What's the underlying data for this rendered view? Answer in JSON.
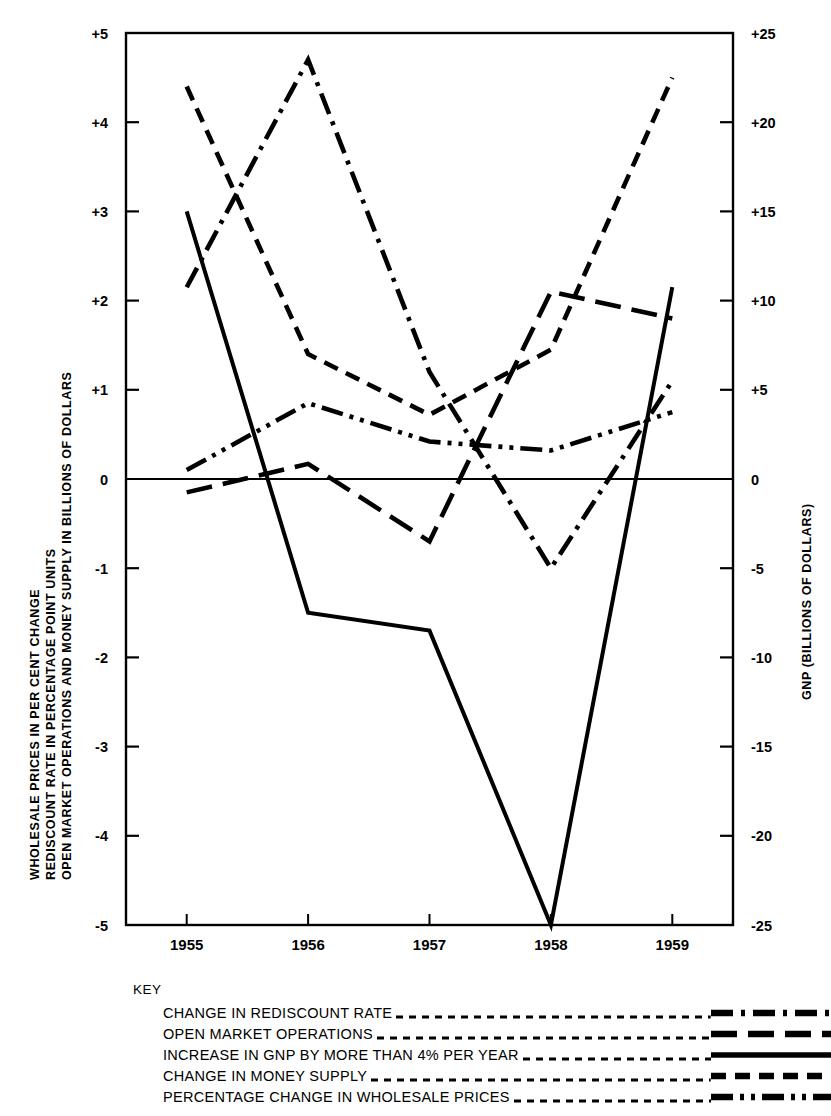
{
  "axes": {
    "left_title_lines": [
      "WHOLESALE PRICES IN PER CENT CHANGE",
      "REDISCOUNT RATE IN PERCENTAGE POINT UNITS",
      "OPEN MARKET OPERATIONS AND MONEY SUPPLY IN BILLIONS OF DOLLARS"
    ],
    "right_title": "GNP (BILLIONS OF DOLLARS)",
    "left_ticks": [
      "+5",
      "+4",
      "+3",
      "+2",
      "+1",
      "0",
      "-1",
      "-2",
      "-3",
      "-4",
      "-5"
    ],
    "right_ticks": [
      "+25",
      "+20",
      "+15",
      "+10",
      "+5",
      "0",
      "-5",
      "-10",
      "-15",
      "-20",
      "-25"
    ],
    "x_ticks": [
      "1955",
      "1956",
      "1957",
      "1958",
      "1959"
    ]
  },
  "key": {
    "title": "KEY",
    "entries": [
      {
        "label": "CHANGE IN REDISCOUNT RATE",
        "style": "dash-dot"
      },
      {
        "label": "OPEN MARKET OPERATIONS",
        "style": "long-dash"
      },
      {
        "label": "INCREASE IN GNP BY MORE THAN 4% PER YEAR",
        "style": "solid"
      },
      {
        "label": "CHANGE IN MONEY SUPPLY",
        "style": "medium-dash"
      },
      {
        "label": "PERCENTAGE CHANGE IN WHOLESALE PRICES",
        "style": "dash-dot-dot"
      }
    ]
  },
  "chart_data": {
    "type": "line",
    "title": "",
    "xlabel": "",
    "ylabel": "WHOLESALE PRICES IN PER CENT CHANGE / REDISCOUNT RATE IN PERCENTAGE POINT UNITS / OPEN MARKET OPERATIONS AND MONEY SUPPLY IN BILLIONS OF DOLLARS",
    "y2label": "GNP (BILLIONS OF DOLLARS)",
    "categories": [
      "1955",
      "1956",
      "1957",
      "1958",
      "1959"
    ],
    "ylim": [
      -5,
      5
    ],
    "y2lim": [
      -25,
      25
    ],
    "grid": false,
    "legend_position": "below",
    "zero_line": true,
    "series": [
      {
        "name": "CHANGE IN REDISCOUNT RATE",
        "style": "dash-dot",
        "axis": "left",
        "values": [
          2.15,
          4.7,
          1.2,
          -1.0,
          1.1
        ]
      },
      {
        "name": "OPEN MARKET OPERATIONS",
        "style": "long-dash",
        "axis": "left",
        "values": [
          -0.15,
          0.17,
          -0.7,
          2.1,
          1.8
        ]
      },
      {
        "name": "INCREASE IN GNP BY MORE THAN 4% PER YEAR",
        "style": "solid",
        "axis": "right",
        "values": [
          15.0,
          -7.5,
          -8.5,
          -25.0,
          10.8
        ],
        "values_left_scale": [
          3.0,
          -1.5,
          -1.7,
          -5.0,
          2.15
        ]
      },
      {
        "name": "CHANGE IN MONEY SUPPLY",
        "style": "medium-dash",
        "axis": "left",
        "values": [
          4.4,
          1.4,
          0.72,
          1.45,
          4.5
        ]
      },
      {
        "name": "PERCENTAGE CHANGE IN WHOLESALE PRICES",
        "style": "dash-dot-dot",
        "axis": "left",
        "values": [
          0.1,
          0.85,
          0.42,
          0.32,
          0.75
        ]
      }
    ]
  },
  "colors": {
    "ink": "#000000",
    "background": "#ffffff"
  }
}
